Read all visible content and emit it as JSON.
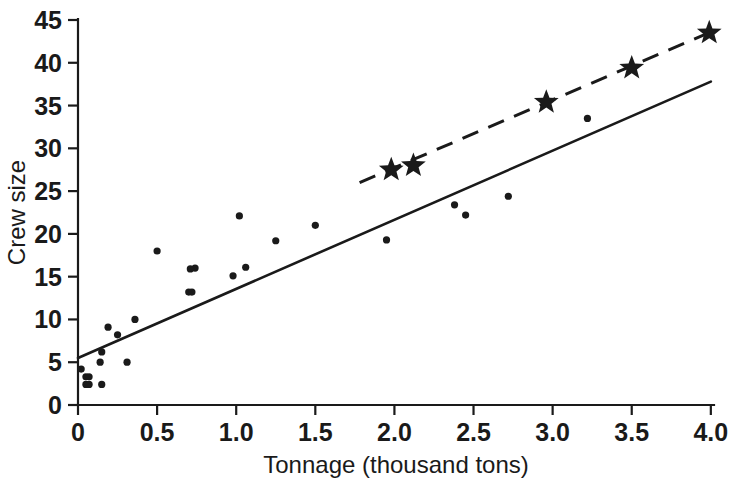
{
  "chart_data": {
    "type": "scatter",
    "title": "",
    "xlabel": "Tonnage (thousand tons)",
    "ylabel": "Crew size",
    "xlim": [
      0,
      4.2
    ],
    "ylim": [
      0,
      46
    ],
    "xticks": [
      0,
      0.5,
      1.0,
      1.5,
      2.0,
      2.5,
      3.0,
      3.5,
      4.0
    ],
    "xticklabels": [
      "0",
      "0.5",
      "1.0",
      "1.5",
      "2.0",
      "2.5",
      "3.0",
      "3.5",
      "4.0"
    ],
    "yticks": [
      0,
      5,
      10,
      15,
      20,
      25,
      30,
      35,
      40,
      45
    ],
    "yticklabels": [
      "0",
      "5",
      "10",
      "15",
      "20",
      "25",
      "30",
      "35",
      "40",
      "45"
    ],
    "grid": false,
    "legend": null,
    "series": [
      {
        "name": "Observed ships",
        "marker": "dot",
        "points": [
          [
            0.02,
            4.2
          ],
          [
            0.05,
            3.3
          ],
          [
            0.07,
            3.3
          ],
          [
            0.05,
            2.4
          ],
          [
            0.07,
            2.4
          ],
          [
            0.15,
            2.4
          ],
          [
            0.14,
            5.0
          ],
          [
            0.15,
            6.2
          ],
          [
            0.19,
            9.1
          ],
          [
            0.25,
            8.2
          ],
          [
            0.31,
            5.0
          ],
          [
            0.36,
            10.0
          ],
          [
            0.5,
            18.0
          ],
          [
            0.7,
            13.2
          ],
          [
            0.74,
            16.0
          ],
          [
            0.71,
            15.9
          ],
          [
            0.72,
            13.2
          ],
          [
            0.98,
            15.1
          ],
          [
            1.02,
            22.1
          ],
          [
            1.06,
            16.1
          ],
          [
            1.25,
            19.2
          ],
          [
            1.5,
            21.0
          ],
          [
            1.95,
            19.3
          ],
          [
            2.38,
            23.4
          ],
          [
            2.45,
            22.2
          ],
          [
            2.72,
            24.4
          ],
          [
            3.22,
            33.5
          ]
        ]
      },
      {
        "name": "Projected designs",
        "marker": "star",
        "points": [
          [
            1.98,
            27.5
          ],
          [
            2.12,
            28.0
          ],
          [
            2.96,
            35.4
          ],
          [
            3.5,
            39.4
          ],
          [
            3.99,
            43.5
          ]
        ]
      }
    ],
    "trend_lines": [
      {
        "name": "solid-regression-line",
        "style": "solid",
        "x": [
          0.0,
          4.0
        ],
        "y": [
          5.5,
          37.8
        ]
      },
      {
        "name": "dashed-projection-line",
        "style": "dashed",
        "x": [
          1.78,
          4.0
        ],
        "y": [
          26.0,
          43.6
        ]
      }
    ]
  }
}
